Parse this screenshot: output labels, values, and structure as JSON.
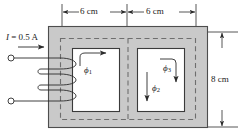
{
  "figure": {
    "name": "magnetic-core-circuit",
    "type": "engineering-diagram",
    "colors": {
      "core_fill": "#c9c9c9",
      "core_edge": "#4d4d4d",
      "window_fill": "#ffffff",
      "line": "#2b2b2b",
      "dashed_path": "#6e6e6e",
      "background": "#ffffff"
    }
  },
  "dimensions": {
    "top_left": {
      "text": "6 cm",
      "value": 6,
      "unit": "cm"
    },
    "top_right": {
      "text": "6 cm",
      "value": 6,
      "unit": "cm"
    },
    "right_side": {
      "text": "8 cm",
      "value": 8,
      "unit": "cm"
    }
  },
  "source": {
    "current_label": "I = 0.5 A",
    "current_symbol": "I",
    "current_equals": " = ",
    "current_value": "0.5 A",
    "coil_turns_drawn": 4,
    "terminals": 2
  },
  "fluxes": [
    {
      "id": "phi1",
      "symbol": "ϕ",
      "subscript": "1",
      "direction": "right",
      "location": "left-window-top"
    },
    {
      "id": "phi2",
      "symbol": "ϕ",
      "subscript": "2",
      "direction": "down",
      "location": "right-window-left"
    },
    {
      "id": "phi3",
      "symbol": "ϕ",
      "subscript": "3",
      "direction": "down",
      "location": "right-window-right"
    }
  ]
}
